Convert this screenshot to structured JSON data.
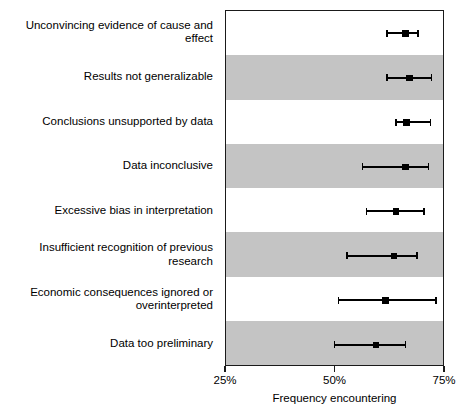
{
  "chart_data": {
    "type": "scatter",
    "title": "",
    "subtitle": "",
    "xlabel": "Frequency encountering",
    "ylabel": "",
    "xlim": [
      25,
      75
    ],
    "xticks": [
      25,
      50,
      75
    ],
    "xticklabels": [
      "25%",
      "50%",
      "75%"
    ],
    "grid": false,
    "legend": null,
    "orientation": "horizontal",
    "marker_style": "square",
    "error_bars": "horizontal-with-caps",
    "band_colors": [
      "#ffffff",
      "#c4c4c4"
    ],
    "categories": [
      "Unconvincing evidence of cause and effect",
      "Results not generalizable",
      "Conclusions unsupported by data",
      "Data inconclusive",
      "Excessive bias in interpretation",
      "Insufficient recognition of previous research",
      "Economic consequences ignored or\noverinterpreted",
      "Data too preliminary"
    ],
    "values": [
      66.0,
      66.9,
      66.2,
      66.0,
      63.8,
      63.3,
      61.4,
      59.3
    ],
    "ci_low": [
      61.7,
      61.7,
      63.8,
      56.2,
      57.1,
      52.6,
      50.7,
      49.8
    ],
    "ci_high": [
      68.8,
      71.9,
      71.7,
      71.2,
      70.2,
      68.6,
      72.9,
      66.0
    ],
    "points": [
      {
        "label": "Unconvincing evidence of cause and effect",
        "value": 66.0,
        "ci_low": 61.7,
        "ci_high": 68.8,
        "band": "plain"
      },
      {
        "label": "Results not generalizable",
        "value": 66.9,
        "ci_low": 61.7,
        "ci_high": 71.9,
        "band": "shaded"
      },
      {
        "label": "Conclusions unsupported by data",
        "value": 66.2,
        "ci_low": 63.8,
        "ci_high": 71.7,
        "band": "plain"
      },
      {
        "label": "Data inconclusive",
        "value": 66.0,
        "ci_low": 56.2,
        "ci_high": 71.2,
        "band": "shaded"
      },
      {
        "label": "Excessive bias in interpretation",
        "value": 63.8,
        "ci_low": 57.1,
        "ci_high": 70.2,
        "band": "plain"
      },
      {
        "label": "Insufficient recognition of previous research",
        "value": 63.3,
        "ci_low": 52.6,
        "ci_high": 68.6,
        "band": "shaded"
      },
      {
        "label": "Economic consequences ignored or\noverinterpreted",
        "value": 61.4,
        "ci_low": 50.7,
        "ci_high": 72.9,
        "band": "plain"
      },
      {
        "label": "Data too preliminary",
        "value": 59.3,
        "ci_low": 49.8,
        "ci_high": 66.0,
        "band": "shaded"
      }
    ]
  },
  "colors": {
    "marker": "#000000",
    "error_bar": "#000000",
    "panel_border": "#1a1a1a",
    "band_shaded": "#c4c4c4",
    "band_plain": "#ffffff",
    "text": "#000000",
    "background": "#ffffff"
  }
}
